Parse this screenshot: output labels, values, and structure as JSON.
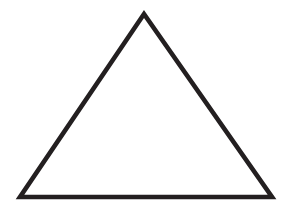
{
  "document": {
    "title": "Triangle",
    "type": "geometric-line-drawing",
    "width": 291,
    "height": 213,
    "background_color": "#ffffff"
  },
  "figure": {
    "name": "equilateral-triangle",
    "shape_label": "triangle",
    "orientation": "apex-up",
    "fill": "none",
    "stroke_color": "#231f20",
    "stroke_width": 4.6,
    "vertices": {
      "apex": {
        "x": 144,
        "y": 14
      },
      "bottom_left": {
        "x": 20,
        "y": 197
      },
      "bottom_right": {
        "x": 272,
        "y": 197
      }
    },
    "points_attr": "144,14 272,197 20,197",
    "edges": [
      {
        "name": "left-edge",
        "from": "apex",
        "to": "bottom_left"
      },
      {
        "name": "right-edge",
        "from": "apex",
        "to": "bottom_right"
      },
      {
        "name": "base-edge",
        "from": "bottom_left",
        "to": "bottom_right"
      }
    ],
    "measurements": {
      "base_width": 252,
      "height": 183
    }
  }
}
